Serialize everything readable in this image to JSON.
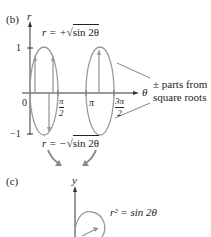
{
  "panel_b": {
    "label": "(b)",
    "axis_y_label": "r",
    "axis_x_label": "θ",
    "y_ticks": [
      "1",
      "−1"
    ],
    "origin_label": "0",
    "x_ticks": [
      {
        "num": "π",
        "den": "2"
      },
      {
        "single": "π"
      },
      {
        "num": "3π",
        "den": "2"
      }
    ],
    "upper_eq_lhs": "r = +",
    "upper_eq_rad": "sin 2θ",
    "lower_eq_lhs": "r = −",
    "lower_eq_rad": "sin 2θ",
    "annotation_line1": "± parts from",
    "annotation_line2": "square roots"
  },
  "panel_c": {
    "label": "(c)",
    "axis_y_label": "y",
    "equation": "r² = sin 2θ"
  },
  "colors": {
    "curve": "#9a9a9a",
    "axis": "#333333",
    "arrow": "#8a8a8a"
  }
}
